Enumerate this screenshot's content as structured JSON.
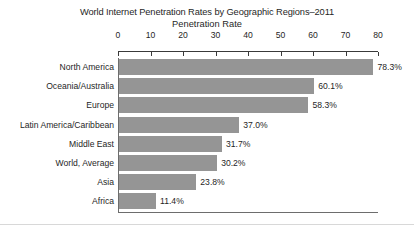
{
  "chart_data": {
    "type": "bar",
    "orientation": "horizontal",
    "title": "World Internet Penetration Rates by Geographic Regions–2011",
    "subtitle": "Penetration Rate",
    "xlabel": "",
    "ylabel": "",
    "xlim": [
      0,
      80
    ],
    "grid": false,
    "legend": null,
    "axis_position": "top",
    "tick_labels": [
      "0",
      "10",
      "20",
      "30",
      "40",
      "50",
      "60",
      "70",
      "80"
    ],
    "ticks": [
      0,
      10,
      20,
      30,
      40,
      50,
      60,
      70,
      80
    ],
    "categories": [
      "North America",
      "Oceania/Australia",
      "Europe",
      "Latin America/Caribbean",
      "Middle East",
      "World, Average",
      "Asia",
      "Africa"
    ],
    "values": [
      78.3,
      60.1,
      58.3,
      37.0,
      31.7,
      30.2,
      23.8,
      11.4
    ],
    "value_labels": [
      "78.3%",
      "60.1%",
      "58.3%",
      "37.0%",
      "31.7%",
      "30.2%",
      "23.8%",
      "11.4%"
    ],
    "bar_color": "#959595",
    "axis_color": "#6d6d6d",
    "text_color": "#1f1f1f",
    "background": "#ffffff"
  }
}
